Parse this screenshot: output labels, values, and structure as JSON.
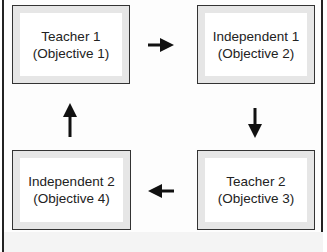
{
  "diagram": {
    "nodes": [
      {
        "id": "tl",
        "line1": "Teacher 1",
        "line2": "(Objective 1)"
      },
      {
        "id": "tr",
        "line1": "Independent 1",
        "line2": "(Objective 2)"
      },
      {
        "id": "br",
        "line1": "Teacher 2",
        "line2": "(Objective 3)"
      },
      {
        "id": "bl",
        "line1": "Independent 2",
        "line2": "(Objective 4)"
      }
    ],
    "edges": [
      {
        "from": "tl",
        "to": "tr",
        "direction": "right"
      },
      {
        "from": "tr",
        "to": "br",
        "direction": "down"
      },
      {
        "from": "br",
        "to": "bl",
        "direction": "left"
      },
      {
        "from": "bl",
        "to": "tl",
        "direction": "up"
      }
    ],
    "colors": {
      "border": "#333333",
      "inset": "#e6e6e6",
      "fill": "#ffffff",
      "arrow": "#111111"
    }
  }
}
